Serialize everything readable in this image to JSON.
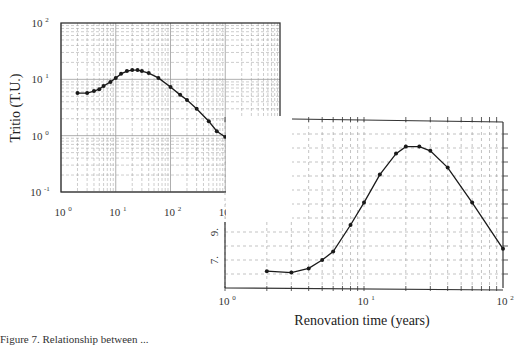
{
  "chart_data": [
    {
      "type": "line",
      "title": "",
      "xlabel": "",
      "ylabel": "Tritio (T.U.)",
      "xscale": "log",
      "yscale": "log",
      "xlim": [
        1,
        10000
      ],
      "ylim": [
        0.1,
        100
      ],
      "grid": true,
      "x_tick_labels": [
        "10^0",
        "10^1",
        "10^2",
        "10^3",
        "10^4"
      ],
      "y_tick_labels": [
        "10^-1",
        "10^0",
        "10^1",
        "10^2"
      ],
      "series": [
        {
          "name": "Tritio",
          "x": [
            2,
            3,
            4,
            5,
            6,
            8,
            10,
            12.5,
            16,
            20,
            25,
            30,
            40,
            60,
            100,
            150,
            200,
            300,
            500,
            700,
            1000,
            1500,
            5000
          ],
          "values": [
            5.7,
            5.7,
            6.2,
            6.7,
            7.6,
            9.0,
            10.6,
            12.5,
            14.0,
            14.6,
            14.6,
            14.0,
            12.9,
            10.6,
            7.3,
            5.3,
            4.3,
            3.0,
            1.8,
            1.2,
            0.95,
            0.63,
            0.19
          ]
        }
      ]
    },
    {
      "type": "line",
      "title": "",
      "xlabel": "Renovation time (years)",
      "ylabel": "",
      "xscale": "log",
      "yscale": "linear",
      "xlim": [
        1,
        100
      ],
      "ylim": [
        5,
        17
      ],
      "grid": true,
      "x_tick_labels": [
        "10^0",
        "10^1",
        "10^2"
      ],
      "y_tick_labels": [
        "7.",
        "9."
      ],
      "series": [
        {
          "name": "Renovation",
          "x": [
            2,
            3,
            4,
            5,
            6,
            8,
            10,
            13,
            17,
            20,
            25,
            30,
            40,
            60,
            100
          ],
          "values": [
            6.2,
            6.1,
            6.4,
            7.0,
            7.6,
            9.5,
            11.1,
            13.1,
            14.6,
            15.1,
            15.1,
            14.8,
            13.6,
            11.1,
            7.8
          ]
        }
      ]
    }
  ],
  "labels": {
    "left_ylabel": "Tritio (T.U.)",
    "right_xlabel": "Renovation time (years)",
    "caption": "Figure 7. Relationship between ..."
  },
  "colors": {
    "line": "#1a1a1a",
    "grid": "#9a9a9a",
    "frame": "#333333"
  }
}
